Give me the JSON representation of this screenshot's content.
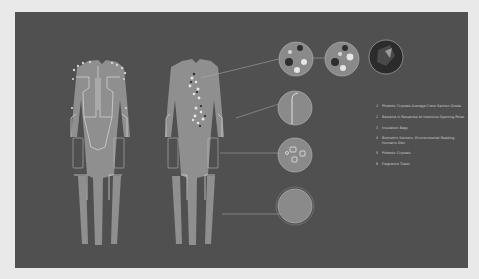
{
  "diagram": {
    "colors": {
      "background": "#e9e9e9",
      "panel": "#505050",
      "suit": "#8f8f8f",
      "outline": "#d0d0d0",
      "text": "#cfcfcf"
    },
    "figures": [
      {
        "name": "back-view-suit"
      },
      {
        "name": "front-view-suit"
      }
    ],
    "callouts": [
      {
        "number": "1",
        "label": "Phototic Crystals Average Cross Section Grade"
      },
      {
        "number": "2",
        "label": "Bacteria in Response to Intensive Opening Pores"
      },
      {
        "number": "3",
        "label": "Insulation Bags"
      },
      {
        "number": "4",
        "label": "Biometric Sensors, Environmental Reading Humanic Don"
      },
      {
        "number": "5",
        "label": "Phototic Crystals"
      },
      {
        "number": "6",
        "label": "Fragrance Tubes"
      }
    ]
  }
}
